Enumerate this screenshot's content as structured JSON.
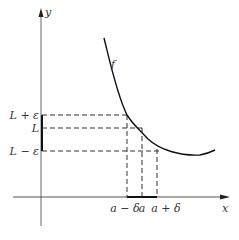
{
  "figure": {
    "axis_labels": {
      "x": "x",
      "y": "y"
    },
    "curve_label": "f",
    "y_labels": {
      "upper": "L + ε",
      "mid": "L",
      "lower": "L − ε"
    },
    "x_labels": {
      "left": "a − δ",
      "mid": "a",
      "right": "a + δ"
    },
    "colors": {
      "line": "#222222",
      "axis": "#555555",
      "background": "#ffffff"
    }
  }
}
